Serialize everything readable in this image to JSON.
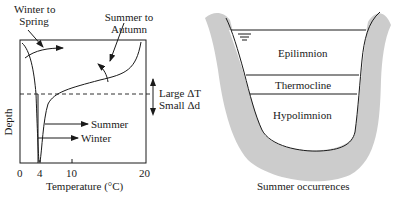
{
  "left_panel": {
    "annotations": {
      "winter_to_spring": [
        "Winter to",
        "Spring"
      ],
      "summer_to_autumn": [
        "Summer to",
        "Autumn"
      ],
      "summer": "Summer",
      "winter": "Winter",
      "large_dt": "Large ΔT",
      "small_dd": "Small Δd"
    },
    "y_axis_label": "Depth",
    "x_axis_label": "Temperature (°C)",
    "x_ticks": [
      "0",
      "4",
      "10",
      "20"
    ]
  },
  "right_panel": {
    "layers": [
      "Epilimnion",
      "Thermocline",
      "Hypolimnion"
    ],
    "caption": "Summer occurrences",
    "water_surface_symbol": "water-surface-icon"
  },
  "colors": {
    "line": "#1a1a1a",
    "shore": "#cccccc",
    "background": "#ffffff"
  }
}
